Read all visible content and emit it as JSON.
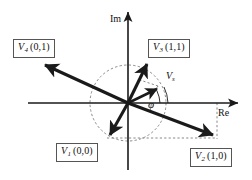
{
  "figure": {
    "type": "space-vector-diagram",
    "background_color": "#ffffff",
    "line_color": "#1a1a1a",
    "dashed_color": "#6b6b6b"
  },
  "axes": {
    "imaginary": {
      "name": "Im",
      "label": "Im",
      "orientation": "vertical",
      "arrow": "up"
    },
    "real": {
      "name": "Re",
      "label": "Re",
      "orientation": "horizontal",
      "arrow": "right"
    }
  },
  "vectors": [
    {
      "id": "V1",
      "symbol": "V",
      "subscript": "1",
      "states": "(0,0)",
      "label": "V1 (0,0)",
      "direction_deg": 230,
      "quadrant": "lower-left"
    },
    {
      "id": "V2",
      "symbol": "V",
      "subscript": "2",
      "states": "(1,0)",
      "label": "V2 (1,0)",
      "direction_deg": 341,
      "quadrant": "lower-right"
    },
    {
      "id": "V3",
      "symbol": "V",
      "subscript": "3",
      "states": "(1,1)",
      "label": "V3 (1,1)",
      "direction_deg": 68,
      "quadrant": "upper-right"
    },
    {
      "id": "V4",
      "symbol": "V",
      "subscript": "4",
      "states": "(0,1)",
      "label": "V4 (0,1)",
      "direction_deg": 161,
      "quadrant": "upper-left"
    }
  ],
  "reference_vector": {
    "id": "Vs",
    "symbol": "V",
    "subscript": "s",
    "label": "Vs",
    "angle_symbol": "φ",
    "angle_name": "phi",
    "direction_deg": 23
  },
  "annotations": {
    "phi": "φ",
    "unit_circle": "dashed reference circle",
    "projection_lines": "dashed projection guides"
  }
}
